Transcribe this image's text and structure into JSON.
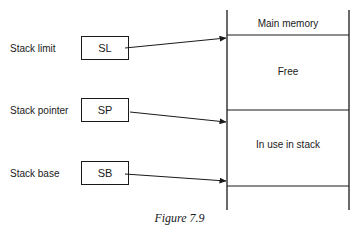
{
  "figure": {
    "caption": "Figure 7.9",
    "registers": [
      {
        "label": "Stack limit",
        "abbr": "SL"
      },
      {
        "label": "Stack pointer",
        "abbr": "SP"
      },
      {
        "label": "Stack base",
        "abbr": "SB"
      }
    ],
    "memory": {
      "title": "Main memory",
      "regions": [
        "Free",
        "In use in stack"
      ]
    }
  }
}
